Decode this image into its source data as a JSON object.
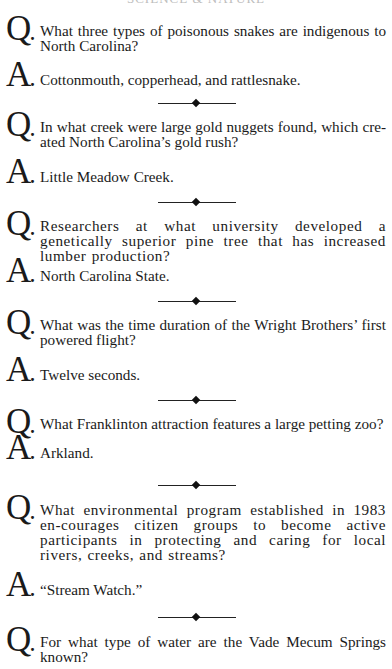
{
  "header": {
    "title": "SCIENCE & NATURE"
  },
  "labels": {
    "question": "Q",
    "answer": "A",
    "dot": "."
  },
  "items": [
    {
      "question": "What three types of poisonous snakes are indigenous to North Carolina?",
      "answer": "Cottonmouth, copperhead, and rattlesnake."
    },
    {
      "question": "In what creek were large gold nuggets found, which cre-ated North Carolina’s gold rush?",
      "answer": "Little Meadow Creek."
    },
    {
      "question": "Researchers at what university developed a genetically superior pine tree that has increased lumber production?",
      "answer": "North Carolina State."
    },
    {
      "question": "What was the time duration of the Wright Brothers’ first powered flight?",
      "answer": "Twelve seconds."
    },
    {
      "question": "What Franklinton attraction features a large petting zoo?",
      "answer": "Arkland."
    },
    {
      "question": "What environmental program established in 1983 en-courages citizen groups to become active participants in protecting and caring for local rivers, creeks, and streams?",
      "answer": "“Stream Watch.”"
    },
    {
      "question": "For what type of water are the Vade Mecum Springs known?",
      "answer": ""
    }
  ],
  "divider": {
    "icon": "diamond-ornament-icon"
  }
}
